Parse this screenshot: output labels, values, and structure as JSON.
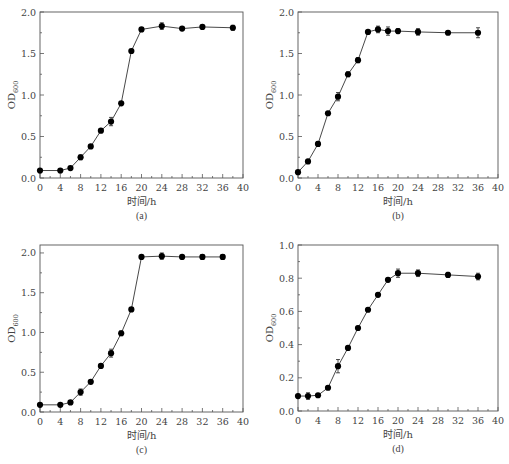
{
  "chart_data": [
    {
      "id": "a",
      "type": "line",
      "panel_label": "(a)",
      "xlabel": "时间/h",
      "ylabel": "OD",
      "ylabel_sub": "600",
      "xlim": [
        0,
        40
      ],
      "ylim": [
        0,
        2.0
      ],
      "xticks": [
        0,
        4,
        8,
        12,
        16,
        20,
        24,
        28,
        32,
        36,
        40
      ],
      "xtick_labels": [
        "0",
        "4",
        "8",
        "12",
        "16",
        "20",
        "24",
        "28",
        "32",
        "36",
        "40"
      ],
      "yticks": [
        0,
        0.5,
        1.0,
        1.5,
        2.0
      ],
      "ytick_labels": [
        "0.0",
        "0.5",
        "1.0",
        "1.5",
        "2.0"
      ],
      "grid": false,
      "series": [
        {
          "name": "OD600",
          "x": [
            0,
            4,
            6,
            8,
            10,
            12,
            14,
            16,
            18,
            20,
            24,
            28,
            32,
            38
          ],
          "y": [
            0.09,
            0.09,
            0.12,
            0.25,
            0.38,
            0.57,
            0.68,
            0.9,
            1.53,
            1.79,
            1.83,
            1.8,
            1.82,
            1.81
          ],
          "err": [
            0.01,
            0.01,
            0.02,
            0.03,
            0.02,
            0.02,
            0.05,
            0.02,
            0.02,
            0.02,
            0.04,
            0.02,
            0.02,
            0.03
          ]
        }
      ]
    },
    {
      "id": "b",
      "type": "line",
      "panel_label": "(b)",
      "xlabel": "时间/h",
      "ylabel": "OD",
      "ylabel_sub": "600",
      "xlim": [
        0,
        40
      ],
      "ylim": [
        0,
        2.0
      ],
      "xticks": [
        0,
        4,
        8,
        12,
        16,
        20,
        24,
        28,
        32,
        36,
        40
      ],
      "xtick_labels": [
        "0",
        "4",
        "8",
        "12",
        "16",
        "20",
        "24",
        "28",
        "32",
        "36",
        "40"
      ],
      "yticks": [
        0,
        0.5,
        1.0,
        1.5,
        2.0
      ],
      "ytick_labels": [
        "0.0",
        "0.5",
        "1.0",
        "1.5",
        "2.0"
      ],
      "grid": false,
      "series": [
        {
          "name": "OD600",
          "x": [
            0,
            2,
            4,
            6,
            8,
            10,
            12,
            14,
            16,
            18,
            20,
            24,
            30,
            36
          ],
          "y": [
            0.07,
            0.2,
            0.41,
            0.78,
            0.98,
            1.25,
            1.42,
            1.76,
            1.79,
            1.77,
            1.77,
            1.76,
            1.75,
            1.75
          ],
          "err": [
            0.01,
            0.02,
            0.03,
            0.02,
            0.05,
            0.03,
            0.03,
            0.01,
            0.04,
            0.05,
            0.03,
            0.04,
            0.02,
            0.06
          ]
        }
      ]
    },
    {
      "id": "c",
      "type": "line",
      "panel_label": "(c)",
      "xlabel": "时间/h",
      "ylabel": "OD",
      "ylabel_sub": "600",
      "xlim": [
        0,
        40
      ],
      "ylim": [
        0,
        2.1
      ],
      "xticks": [
        0,
        4,
        8,
        12,
        16,
        20,
        24,
        28,
        32,
        36,
        40
      ],
      "xtick_labels": [
        "0",
        "4",
        "8",
        "12",
        "16",
        "20",
        "24",
        "28",
        "32",
        "36",
        "40"
      ],
      "yticks": [
        0,
        0.5,
        1.0,
        1.5,
        2.0
      ],
      "ytick_labels": [
        "0.0",
        "0.5",
        "1.0",
        "1.5",
        "2.0"
      ],
      "grid": false,
      "series": [
        {
          "name": "OD600",
          "x": [
            0,
            4,
            6,
            8,
            10,
            12,
            14,
            16,
            18,
            20,
            24,
            28,
            32,
            36
          ],
          "y": [
            0.09,
            0.09,
            0.12,
            0.25,
            0.38,
            0.58,
            0.74,
            0.99,
            1.29,
            1.95,
            1.96,
            1.95,
            1.95,
            1.95
          ],
          "err": [
            0.01,
            0.01,
            0.02,
            0.04,
            0.02,
            0.02,
            0.05,
            0.03,
            0.02,
            0.02,
            0.04,
            0.02,
            0.03,
            0.03
          ]
        }
      ]
    },
    {
      "id": "d",
      "type": "line",
      "panel_label": "(d)",
      "xlabel": "时间/h",
      "ylabel": "OD",
      "ylabel_sub": "600",
      "xlim": [
        0,
        40
      ],
      "ylim": [
        0,
        1.0
      ],
      "xticks": [
        0,
        4,
        8,
        12,
        16,
        20,
        24,
        28,
        32,
        36,
        40
      ],
      "xtick_labels": [
        "0",
        "4",
        "8",
        "12",
        "16",
        "20",
        "24",
        "28",
        "32",
        "36",
        "40"
      ],
      "yticks": [
        0,
        0.2,
        0.4,
        0.6,
        0.8,
        1.0
      ],
      "ytick_labels": [
        "0.0",
        "0.2",
        "0.4",
        "0.6",
        "0.8",
        "1.0"
      ],
      "grid": false,
      "series": [
        {
          "name": "OD600",
          "x": [
            0,
            2,
            4,
            6,
            8,
            10,
            12,
            14,
            16,
            18,
            20,
            24,
            30,
            36
          ],
          "y": [
            0.09,
            0.09,
            0.095,
            0.14,
            0.27,
            0.38,
            0.5,
            0.61,
            0.7,
            0.79,
            0.83,
            0.83,
            0.82,
            0.81
          ],
          "err": [
            0.01,
            0.02,
            0.01,
            0.01,
            0.04,
            0.01,
            0.01,
            0.01,
            0.01,
            0.01,
            0.025,
            0.02,
            0.015,
            0.02
          ]
        }
      ]
    }
  ]
}
